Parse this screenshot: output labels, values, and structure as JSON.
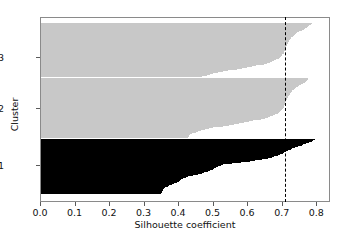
{
  "figure": {
    "top_text_fragment": "",
    "background": "#ffffff",
    "frame_color": "#8a8a8a"
  },
  "chart_data": {
    "type": "area",
    "title": "",
    "xlabel": "Silhouette coefficient",
    "ylabel": "Cluster",
    "xlim": [
      0.0,
      0.84
    ],
    "ylim": [
      0,
      1
    ],
    "grid": false,
    "legend": null,
    "xticks": [
      0.0,
      0.1,
      0.2,
      0.3,
      0.4,
      0.5,
      0.6,
      0.7,
      0.8
    ],
    "xticklabels": [
      "0.0",
      "0.1",
      "0.2",
      "0.3",
      "0.4",
      "0.5",
      "0.6",
      "0.7",
      "0.8"
    ],
    "yticks": [
      1,
      2,
      3
    ],
    "yticklabels": [
      "1",
      "2",
      "3"
    ],
    "average_silhouette": 0.71,
    "average_line_style": "dashed",
    "average_line_color": "#000000",
    "clusters": [
      {
        "label": "3",
        "color": "#c8c8c8",
        "y_top_frac": 0.027,
        "y_bottom_frac": 0.324,
        "tick_frac": 0.216,
        "silhouette_profile": [
          0.79,
          0.788,
          0.785,
          0.782,
          0.779,
          0.775,
          0.771,
          0.767,
          0.762,
          0.757,
          0.752,
          0.748,
          0.744,
          0.741,
          0.738,
          0.735,
          0.732,
          0.73,
          0.728,
          0.726,
          0.724,
          0.722,
          0.721,
          0.72,
          0.719,
          0.718,
          0.717,
          0.716,
          0.715,
          0.714,
          0.713,
          0.712,
          0.711,
          0.71,
          0.709,
          0.708,
          0.706,
          0.704,
          0.702,
          0.7,
          0.697,
          0.694,
          0.69,
          0.686,
          0.681,
          0.675,
          0.668,
          0.66,
          0.65,
          0.639,
          0.627,
          0.614,
          0.6,
          0.586,
          0.572,
          0.558,
          0.544,
          0.53,
          0.516,
          0.503,
          0.492,
          0.483,
          0.476,
          0.47
        ]
      },
      {
        "label": "2",
        "color": "#c8c8c8",
        "y_top_frac": 0.33,
        "y_bottom_frac": 0.654,
        "tick_frac": 0.492,
        "silhouette_profile": [
          0.78,
          0.778,
          0.775,
          0.772,
          0.769,
          0.765,
          0.761,
          0.757,
          0.753,
          0.749,
          0.745,
          0.742,
          0.739,
          0.736,
          0.733,
          0.731,
          0.729,
          0.727,
          0.725,
          0.723,
          0.721,
          0.72,
          0.719,
          0.718,
          0.717,
          0.716,
          0.715,
          0.714,
          0.713,
          0.712,
          0.711,
          0.71,
          0.709,
          0.708,
          0.707,
          0.705,
          0.703,
          0.701,
          0.698,
          0.695,
          0.691,
          0.687,
          0.682,
          0.676,
          0.669,
          0.661,
          0.652,
          0.642,
          0.631,
          0.619,
          0.606,
          0.592,
          0.577,
          0.562,
          0.547,
          0.532,
          0.517,
          0.503,
          0.49,
          0.478,
          0.468,
          0.459,
          0.451,
          0.445,
          0.44,
          0.436,
          0.433,
          0.431,
          0.43
        ]
      },
      {
        "label": "1",
        "color": "#000000",
        "y_top_frac": 0.66,
        "y_bottom_frac": 0.962,
        "tick_frac": 0.8,
        "silhouette_profile": [
          0.8,
          0.798,
          0.796,
          0.793,
          0.79,
          0.786,
          0.782,
          0.778,
          0.774,
          0.77,
          0.765,
          0.76,
          0.755,
          0.75,
          0.745,
          0.74,
          0.736,
          0.732,
          0.728,
          0.724,
          0.721,
          0.718,
          0.715,
          0.712,
          0.709,
          0.706,
          0.702,
          0.698,
          0.694,
          0.69,
          0.685,
          0.68,
          0.674,
          0.668,
          0.661,
          0.653,
          0.644,
          0.634,
          0.623,
          0.611,
          0.598,
          0.584,
          0.57,
          0.556,
          0.543,
          0.531,
          0.524,
          0.52,
          0.517,
          0.514,
          0.511,
          0.508,
          0.505,
          0.502,
          0.498,
          0.494,
          0.49,
          0.486,
          0.481,
          0.476,
          0.47,
          0.464,
          0.457,
          0.45,
          0.443,
          0.436,
          0.429,
          0.423,
          0.418,
          0.414,
          0.411,
          0.409,
          0.407,
          0.405,
          0.403,
          0.4,
          0.397,
          0.393,
          0.389,
          0.385,
          0.381,
          0.377,
          0.373,
          0.369,
          0.366,
          0.363,
          0.361,
          0.359,
          0.358,
          0.357,
          0.356,
          0.355,
          0.354,
          0.353,
          0.352,
          0.351,
          0.35
        ]
      }
    ]
  }
}
